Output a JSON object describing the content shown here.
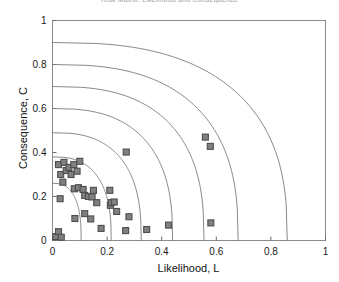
{
  "chart_data": {
    "type": "scatter",
    "title": "Risk Matrix: Likelihood and Consequence",
    "xlabel": "Likelihood, L",
    "ylabel": "Consequence, C",
    "xlim": [
      0,
      1
    ],
    "ylim": [
      0,
      1
    ],
    "xticks": [
      0,
      0.2,
      0.4,
      0.6,
      0.8,
      1
    ],
    "xtick_labels": [
      "0",
      "0.2",
      "0.4",
      "0.6",
      "0.8",
      "1"
    ],
    "yticks": [
      0,
      0.2,
      0.4,
      0.6,
      0.8,
      1
    ],
    "ytick_labels": [
      "0",
      "0.2",
      "0.4",
      "0.6",
      "0.8",
      "1"
    ],
    "grid": false,
    "legend": null,
    "marker": {
      "shape": "square",
      "fill_color": "#808080",
      "edge_color": "#4d4d4d",
      "size_px": 6
    },
    "series": [
      {
        "name": "Risk items",
        "marker": "square",
        "points": [
          [
            0.022,
            0.345
          ],
          [
            0.03,
            0.3
          ],
          [
            0.038,
            0.265
          ],
          [
            0.042,
            0.355
          ],
          [
            0.05,
            0.318
          ],
          [
            0.06,
            0.332
          ],
          [
            0.068,
            0.3
          ],
          [
            0.078,
            0.345
          ],
          [
            0.09,
            0.315
          ],
          [
            0.1,
            0.36
          ],
          [
            0.028,
            0.19
          ],
          [
            0.08,
            0.235
          ],
          [
            0.095,
            0.24
          ],
          [
            0.112,
            0.232
          ],
          [
            0.118,
            0.205
          ],
          [
            0.132,
            0.2
          ],
          [
            0.145,
            0.198
          ],
          [
            0.15,
            0.228
          ],
          [
            0.162,
            0.172
          ],
          [
            0.118,
            0.122
          ],
          [
            0.082,
            0.1
          ],
          [
            0.14,
            0.098
          ],
          [
            0.21,
            0.228
          ],
          [
            0.212,
            0.16
          ],
          [
            0.215,
            0.172
          ],
          [
            0.226,
            0.175
          ],
          [
            0.235,
            0.132
          ],
          [
            0.178,
            0.055
          ],
          [
            0.27,
            0.402
          ],
          [
            0.28,
            0.108
          ],
          [
            0.268,
            0.045
          ],
          [
            0.345,
            0.05
          ],
          [
            0.425,
            0.07
          ],
          [
            0.56,
            0.47
          ],
          [
            0.578,
            0.428
          ],
          [
            0.58,
            0.08
          ],
          [
            0.012,
            0.018
          ],
          [
            0.022,
            0.04
          ],
          [
            0.032,
            0.015
          ]
        ]
      }
    ],
    "iso_risk_curves": {
      "description": "Constant-risk contour lines",
      "count": 7,
      "y_intercepts": [
        0.9,
        0.8,
        0.7,
        0.6,
        0.49,
        0.38,
        0.26
      ],
      "x_intercepts": [
        0.86,
        0.68,
        0.555,
        0.44,
        0.325,
        0.215,
        0.105
      ],
      "color": "#7a7a7a"
    }
  }
}
